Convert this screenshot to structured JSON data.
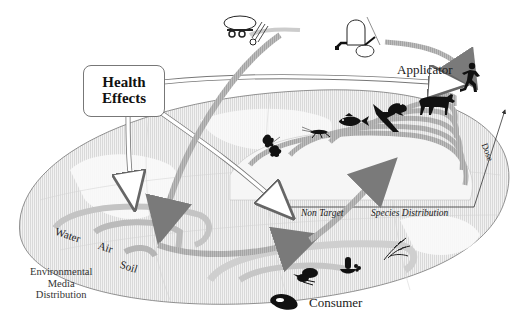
{
  "diagram": {
    "type": "pesticide exposure pathway illustration",
    "labels": {
      "health_effects_line1": "Health",
      "health_effects_line2": "Effects",
      "applicator": "Applicator",
      "consumer": "Consumer",
      "environmental_line1": "Environmental",
      "environmental_line2": "Media",
      "environmental_line3": "Distribution",
      "water": "Water",
      "air": "Air",
      "soil": "Soil",
      "non_target": "Non Target",
      "species_distribution": "Species Distribution",
      "dose_axis": "Dose"
    },
    "icons": [
      "tank-sprayer-trailer-icon",
      "backpack-sprayer-icon",
      "running-person-icon",
      "cow-icon",
      "frog-icon",
      "bird-icon",
      "fish-icon",
      "cricket-icon",
      "oak-leaf-icon",
      "vegetables-icon",
      "fruit-bowl-icon",
      "wheat-icon",
      "steak-icon"
    ],
    "colors": {
      "globe_fill": "#e6e6e6",
      "globe_outline": "#777777",
      "arrow_dark": "#8a8a8a",
      "arrow_light": "#cfcfcf",
      "silhouette": "#111111",
      "text": "#1a1a1a"
    }
  }
}
